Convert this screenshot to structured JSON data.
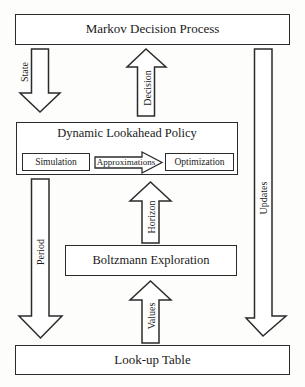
{
  "diagram": {
    "title_top": "Markov Decision Process",
    "title_bottom": "Look-up Table",
    "policy": {
      "title": "Dynamic Lookahead Policy",
      "simulation": "Simulation",
      "approximations": "Approximations",
      "optimization": "Optimization"
    },
    "exploration": "Boltzmann Exploration",
    "edges": {
      "state": "State",
      "decision": "Decision",
      "updates": "Updates",
      "period": "Period",
      "horizon": "Horizon",
      "values": "Values"
    },
    "colors": {
      "stroke": "#2b2b2b",
      "fill": "#ffffff",
      "text": "#1a1a1a",
      "background": "#fdfdfc"
    }
  }
}
